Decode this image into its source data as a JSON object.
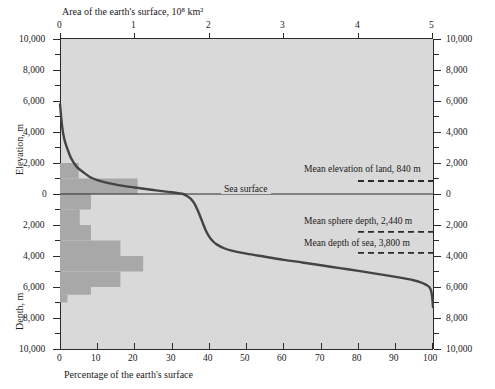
{
  "chart_data": {
    "type": "line",
    "title": "",
    "top_axis": {
      "label": "Area of the earth's surface, 10⁸ km²",
      "ticks": [
        "0",
        "1",
        "2",
        "3",
        "4",
        "5"
      ],
      "range": [
        0,
        5
      ]
    },
    "bottom_axis": {
      "label": "Percentage of the earth's surface",
      "ticks": [
        "0",
        "10",
        "20",
        "30",
        "40",
        "50",
        "60",
        "70",
        "80",
        "90",
        "100"
      ],
      "range": [
        0,
        100
      ]
    },
    "left_axis_upper": {
      "label": "Elevation, m",
      "ticks": [
        "10,000",
        "8,000",
        "6,000",
        "4,000",
        "2,000",
        "0"
      ]
    },
    "left_axis_lower": {
      "label": "Depth, m",
      "ticks": [
        "2,000",
        "4,000",
        "6,000",
        "8,000",
        "10,000"
      ]
    },
    "right_axis_upper": {
      "ticks": [
        "10,000",
        "8,000",
        "6,000",
        "4,000",
        "2,000",
        "0"
      ]
    },
    "right_axis_lower": {
      "ticks": [
        "2,000",
        "4,000",
        "6,000",
        "8,000",
        "10,000"
      ]
    },
    "ylim": [
      -10000,
      10000
    ],
    "grid": false,
    "legend": "none",
    "series": [
      {
        "name": "Hypsographic curve",
        "x": [
          0,
          0.6,
          1.2,
          2,
          3,
          4.5,
          6,
          8,
          10,
          13,
          16,
          20,
          25,
          29,
          30,
          31,
          32,
          33,
          34,
          35,
          36,
          37,
          38,
          39,
          40,
          41,
          42,
          44,
          46,
          50,
          55,
          60,
          65,
          70,
          75,
          80,
          85,
          90,
          93,
          95,
          96.5,
          97.5,
          98.3,
          99,
          99.5,
          99.8,
          100
        ],
        "y": [
          5800,
          4300,
          3500,
          2900,
          2300,
          1750,
          1450,
          1100,
          900,
          700,
          560,
          420,
          260,
          140,
          110,
          80,
          40,
          0,
          -120,
          -300,
          -600,
          -1100,
          -1700,
          -2300,
          -2750,
          -3050,
          -3250,
          -3500,
          -3650,
          -3850,
          -4050,
          -4250,
          -4420,
          -4600,
          -4780,
          -4960,
          -5150,
          -5350,
          -5480,
          -5580,
          -5680,
          -5780,
          -5880,
          -6000,
          -6250,
          -6700,
          -7300
        ]
      }
    ],
    "histogram": {
      "name": "Area distribution by elevation band",
      "orientation": "horizontal",
      "bands": [
        {
          "top_m": 2000,
          "bottom_m": 1000,
          "percent": 5.0
        },
        {
          "top_m": 1000,
          "bottom_m": 0,
          "percent": 20.8
        },
        {
          "top_m": 0,
          "bottom_m": -1000,
          "percent": 8.3
        },
        {
          "top_m": -1000,
          "bottom_m": -2000,
          "percent": 5.3
        },
        {
          "top_m": -2000,
          "bottom_m": -3000,
          "percent": 8.3
        },
        {
          "top_m": -3000,
          "bottom_m": -4000,
          "percent": 16.2
        },
        {
          "top_m": -4000,
          "bottom_m": -5000,
          "percent": 22.3
        },
        {
          "top_m": -5000,
          "bottom_m": -6000,
          "percent": 16.2
        },
        {
          "top_m": -6000,
          "bottom_m": -6500,
          "percent": 8.3
        },
        {
          "top_m": -6500,
          "bottom_m": -7000,
          "percent": 2.0
        }
      ]
    },
    "annotations": [
      {
        "id": "sea-surface",
        "text": "Sea surface",
        "level_m": 0
      },
      {
        "id": "mean-elevation",
        "text": "Mean elevation of land, 840 m",
        "level_m": 840
      },
      {
        "id": "mean-sphere",
        "text": "Mean sphere depth, 2,440 m",
        "level_m": -2440
      },
      {
        "id": "mean-sea-depth",
        "text": "Mean depth of sea, 3,800 m",
        "level_m": -3800
      }
    ]
  },
  "colors": {
    "plot_background": "#d9d9d9",
    "histogram_fill": "#a8a8a8",
    "curve": "#444444",
    "axis": "#2a2a2a",
    "text": "#1a1a1a"
  }
}
